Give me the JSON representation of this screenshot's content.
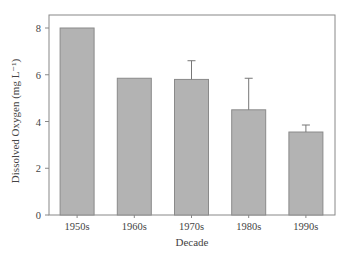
{
  "chart_data": {
    "type": "bar",
    "title": "",
    "xlabel": "Decade",
    "ylabel": "Dissolved Oxygen (mg L⁻¹)",
    "categories": [
      "1950s",
      "1960s",
      "1970s",
      "1980s",
      "1990s"
    ],
    "values": [
      8.0,
      5.85,
      5.8,
      4.5,
      3.55
    ],
    "error_upper": [
      null,
      null,
      6.6,
      5.85,
      3.85
    ],
    "ylim": [
      0,
      8.5
    ],
    "yticks": [
      0,
      2,
      4,
      6,
      8
    ],
    "grid": false,
    "legend": null,
    "colors": {
      "bar_fill": "#b3b3b3",
      "bar_stroke": "#8a8a8a",
      "axis": "#888888"
    }
  }
}
